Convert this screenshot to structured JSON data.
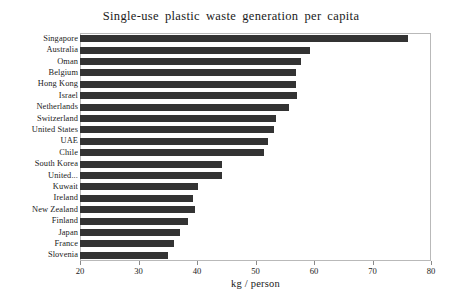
{
  "chart_data": {
    "type": "bar",
    "orientation": "horizontal",
    "title": "Single-use plastic waste generation per capita",
    "xlabel": "kg / person",
    "ylabel": "",
    "xlim": [
      20,
      80
    ],
    "xticks": [
      20,
      30,
      40,
      50,
      60,
      70,
      80
    ],
    "grid": false,
    "legend": null,
    "bar_color": "#333333",
    "frame_color": "#b9b9b9",
    "categories": [
      "Singapore",
      "Australia",
      "Oman",
      "Belgium",
      "Hong Kong",
      "Israel",
      "Netherlands",
      "Switzerland",
      "United States",
      "UAE",
      "Chile",
      "South Korea",
      "United...",
      "Kuwait",
      "Ireland",
      "New Zealand",
      "Finland",
      "Japan",
      "France",
      "Slovenia"
    ],
    "values": [
      76.0,
      59.4,
      57.7,
      57.0,
      56.9,
      57.1,
      55.8,
      53.5,
      53.2,
      52.1,
      51.4,
      44.2,
      44.3,
      40.1,
      39.4,
      39.6,
      38.5,
      37.1,
      36.1,
      35.1
    ]
  }
}
